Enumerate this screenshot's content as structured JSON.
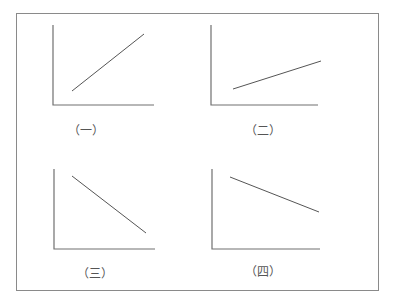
{
  "diagram": {
    "panels": [
      {
        "label": "（一）",
        "trend": "increasing-steep",
        "axes": {
          "origin": [
            53,
            105
          ],
          "y_top": 25,
          "x_end": 154
        },
        "line": [
          [
            72,
            91
          ],
          [
            144,
            34
          ]
        ],
        "label_pos": [
          86,
          129
        ]
      },
      {
        "label": "（二）",
        "trend": "increasing-gentle",
        "axes": {
          "origin": [
            211,
            105
          ],
          "y_top": 25,
          "x_end": 318
        },
        "line": [
          [
            233,
            89
          ],
          [
            321,
            61
          ]
        ],
        "label_pos": [
          263,
          129
        ]
      },
      {
        "label": "（三）",
        "trend": "decreasing-steep",
        "axes": {
          "origin": [
            54,
            249
          ],
          "y_top": 169,
          "x_end": 155
        },
        "line": [
          [
            72,
            176
          ],
          [
            146,
            233
          ]
        ],
        "label_pos": [
          95,
          272
        ]
      },
      {
        "label": "（四）",
        "trend": "decreasing-gentle",
        "axes": {
          "origin": [
            212,
            249
          ],
          "y_top": 169,
          "x_end": 320
        },
        "line": [
          [
            230,
            177
          ],
          [
            319,
            212
          ]
        ],
        "label_pos": [
          263,
          270
        ]
      }
    ],
    "colors": {
      "axis": "#707070",
      "line": "#555555",
      "frame": "#8a8a8a"
    }
  }
}
